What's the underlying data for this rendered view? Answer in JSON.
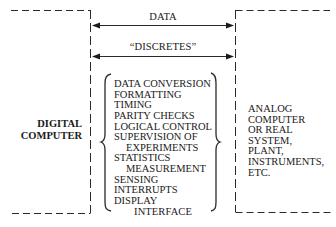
{
  "diagram": {
    "left_block": {
      "label_lines": [
        "DIGITAL",
        "COMPUTER"
      ]
    },
    "right_block": {
      "label_lines": [
        "ANALOG",
        "COMPUTER",
        "OR REAL",
        "SYSTEM,",
        "PLANT,",
        "INSTRUMENTS,",
        "ETC."
      ]
    },
    "arrows": [
      {
        "label": "DATA",
        "direction": "bidirectional"
      },
      {
        "label": "“DISCRETES”",
        "direction": "bidirectional"
      }
    ],
    "interface_functions": [
      {
        "text": "DATA CONVERSION",
        "indent": 0
      },
      {
        "text": "FORMATTING",
        "indent": 0
      },
      {
        "text": "TIMING",
        "indent": 0
      },
      {
        "text": "PARITY CHECKS",
        "indent": 0
      },
      {
        "text": "LOGICAL CONTROL",
        "indent": 0
      },
      {
        "text": "SUPERVISION OF",
        "indent": 0
      },
      {
        "text": "EXPERIMENTS",
        "indent": 12
      },
      {
        "text": "STATISTICS",
        "indent": 0
      },
      {
        "text": "MEASUREMENT",
        "indent": 12
      },
      {
        "text": "SENSING",
        "indent": 0
      },
      {
        "text": "INTERRUPTS",
        "indent": 0
      },
      {
        "text": "DISPLAY",
        "indent": 0
      }
    ],
    "interface_label": "INTERFACE",
    "colors": {
      "line": "#2a2a2a",
      "text": "#1a1a1a",
      "background": "#ffffff"
    }
  }
}
